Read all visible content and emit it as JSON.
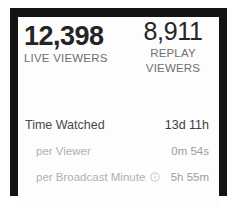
{
  "card": {
    "stats": [
      {
        "name": "live-viewers",
        "value": "12,398",
        "label": "LIVE VIEWERS"
      },
      {
        "name": "replay-viewers",
        "value": "8,911",
        "label_line1": "REPLAY",
        "label_line2": "VIEWERS"
      }
    ],
    "rows": [
      {
        "label": "Time Watched",
        "value": "13d 11h"
      },
      {
        "label": "per Viewer",
        "value": "0m 54s"
      },
      {
        "label": "per Broadcast Minute",
        "value": "5h 55m",
        "icon": "info-icon"
      }
    ]
  },
  "colors": {
    "bezel": "#141414",
    "card_background": "#fdfdfd",
    "value_primary": "#252525",
    "label_muted": "#6f6f6f",
    "row_label": "#4a4a4a",
    "row_sub_label": "#b0b0b0",
    "row_sub_value": "#9d9d9d"
  }
}
